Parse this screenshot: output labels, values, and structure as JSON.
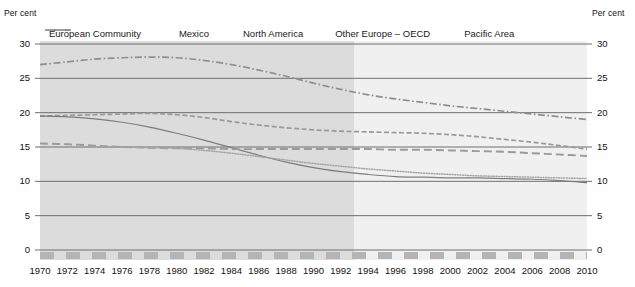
{
  "axis": {
    "unit_left": "Per cent",
    "unit_right": "Per cent",
    "y_ticks": [
      "30",
      "25",
      "20",
      "15",
      "10",
      "5",
      "0"
    ],
    "x_ticks": [
      "1970",
      "1972",
      "1974",
      "1976",
      "1978",
      "1980",
      "1982",
      "1984",
      "1986",
      "1988",
      "1990",
      "1992",
      "1994",
      "1996",
      "1998",
      "2000",
      "2002",
      "2004",
      "2006",
      "2008",
      "2010"
    ]
  },
  "legend": {
    "items": [
      {
        "label": "European Community",
        "style": "long-dash",
        "color": "#9a9a9a",
        "icon": "legend-line-european-community"
      },
      {
        "label": "Mexico",
        "style": "dash-dot",
        "color": "#8f8f8f",
        "icon": "legend-line-mexico"
      },
      {
        "label": "North America",
        "style": "solid",
        "color": "#7d7d7d",
        "icon": "legend-line-north-america"
      },
      {
        "label": "Other Europe – OECD",
        "style": "dash",
        "color": "#9a9a9a",
        "icon": "legend-line-other-europe-oecd"
      },
      {
        "label": "Pacific Area",
        "style": "dotted",
        "color": "#a5a5a5",
        "icon": "legend-line-pacific-area"
      }
    ]
  },
  "colors": {
    "history_band": "#dcdcdc",
    "forecast_band": "#f0f0f0",
    "gridline": "#6f6f6f",
    "baseline_marker": "#b4b4b4",
    "plot_border": "#d8d8d8"
  },
  "chart_data": {
    "type": "line",
    "title": "",
    "subtitle": "",
    "xlabel": "",
    "ylabel": "Per cent",
    "ylim": [
      0,
      30
    ],
    "xlim": [
      1970,
      2010
    ],
    "grid": true,
    "legend_position": "top",
    "y_unit": "per cent",
    "x_tick_step": 2,
    "y_tick_step": 5,
    "annotations": [
      {
        "type": "shaded-region",
        "label": "history",
        "x_from": 1970,
        "x_to": 1993
      },
      {
        "type": "shaded-region",
        "label": "projection",
        "x_from": 1993,
        "x_to": 2010
      }
    ],
    "x": [
      1970,
      1972,
      1974,
      1976,
      1978,
      1980,
      1982,
      1984,
      1986,
      1988,
      1990,
      1992,
      1994,
      1996,
      1998,
      2000,
      2002,
      2004,
      2006,
      2008,
      2010
    ],
    "series": [
      {
        "name": "European Community",
        "style": "long-dash",
        "values": [
          19.5,
          19.6,
          19.7,
          19.8,
          19.9,
          19.7,
          19.3,
          18.7,
          18.2,
          17.8,
          17.5,
          17.3,
          17.2,
          17.1,
          17.0,
          16.8,
          16.5,
          16.1,
          15.7,
          15.2,
          14.7
        ]
      },
      {
        "name": "Mexico",
        "style": "dash-dot",
        "values": [
          27.0,
          27.4,
          27.8,
          28.0,
          28.1,
          28.0,
          27.6,
          27.0,
          26.2,
          25.3,
          24.3,
          23.4,
          22.6,
          22.0,
          21.5,
          21.0,
          20.6,
          20.2,
          19.8,
          19.4,
          19.0
        ]
      },
      {
        "name": "North America",
        "style": "solid",
        "values": [
          19.5,
          19.4,
          19.1,
          18.6,
          17.9,
          17.0,
          16.0,
          14.9,
          13.8,
          12.8,
          12.0,
          11.4,
          11.0,
          10.7,
          10.6,
          10.5,
          10.5,
          10.4,
          10.3,
          10.1,
          9.8
        ]
      },
      {
        "name": "Other Europe – OECD",
        "style": "dash",
        "values": [
          15.5,
          15.4,
          15.2,
          15.0,
          14.9,
          14.8,
          14.8,
          14.7,
          14.7,
          14.7,
          14.7,
          14.7,
          14.7,
          14.6,
          14.6,
          14.5,
          14.4,
          14.3,
          14.1,
          13.9,
          13.7
        ]
      },
      {
        "name": "Pacific Area",
        "style": "dotted",
        "values": [
          15.0,
          15.0,
          15.0,
          15.0,
          14.9,
          14.8,
          14.5,
          14.1,
          13.6,
          13.1,
          12.6,
          12.2,
          11.8,
          11.5,
          11.2,
          11.0,
          10.8,
          10.7,
          10.6,
          10.5,
          10.4
        ]
      }
    ]
  }
}
